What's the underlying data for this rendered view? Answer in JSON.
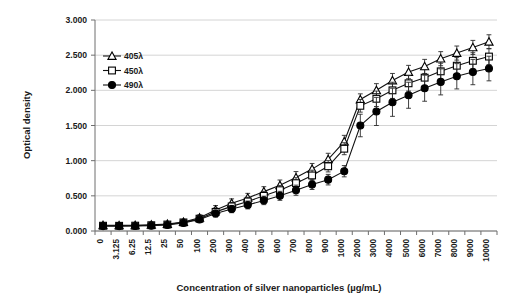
{
  "chart_data": {
    "type": "line",
    "title": "",
    "xlabel": "Concentration of silver nanoparticles (µg/mL)",
    "ylabel": "Optical density",
    "grid": true,
    "legend_position": "inside-upper-left",
    "ylim": [
      0.0,
      3.0
    ],
    "ytick_labels": [
      "0.000",
      "0.500",
      "1.000",
      "1.500",
      "2.000",
      "2.500",
      "3.000"
    ],
    "ytick_values": [
      0.0,
      0.5,
      1.0,
      1.5,
      2.0,
      2.5,
      3.0
    ],
    "categories": [
      "0",
      "3.125",
      "6.25",
      "12.5",
      "25",
      "50",
      "100",
      "200",
      "300",
      "400",
      "500",
      "600",
      "700",
      "800",
      "900",
      "1000",
      "2000",
      "3000",
      "4000",
      "5000",
      "6000",
      "7000",
      "8000",
      "9000",
      "10000"
    ],
    "series": [
      {
        "name": "405λ",
        "marker": "open-triangle",
        "values": [
          0.082,
          0.08,
          0.082,
          0.088,
          0.098,
          0.128,
          0.188,
          0.3,
          0.395,
          0.47,
          0.56,
          0.65,
          0.76,
          0.88,
          1.02,
          1.27,
          1.87,
          2.0,
          2.14,
          2.26,
          2.34,
          2.45,
          2.53,
          2.61,
          2.69
        ],
        "errors": [
          0.02,
          0.018,
          0.018,
          0.02,
          0.022,
          0.026,
          0.04,
          0.062,
          0.062,
          0.065,
          0.07,
          0.075,
          0.085,
          0.08,
          0.085,
          0.09,
          0.08,
          0.095,
          0.1,
          0.095,
          0.1,
          0.1,
          0.1,
          0.1,
          0.1
        ]
      },
      {
        "name": "450λ",
        "marker": "open-square",
        "values": [
          0.075,
          0.074,
          0.076,
          0.082,
          0.092,
          0.122,
          0.175,
          0.272,
          0.35,
          0.42,
          0.5,
          0.58,
          0.68,
          0.79,
          0.92,
          1.17,
          1.78,
          1.88,
          2.0,
          2.1,
          2.18,
          2.27,
          2.35,
          2.42,
          2.48
        ],
        "errors": [
          0.018,
          0.016,
          0.016,
          0.018,
          0.02,
          0.024,
          0.036,
          0.055,
          0.056,
          0.06,
          0.064,
          0.068,
          0.078,
          0.075,
          0.08,
          0.085,
          0.09,
          0.11,
          0.115,
          0.11,
          0.115,
          0.115,
          0.115,
          0.115,
          0.115
        ]
      },
      {
        "name": "490λ",
        "marker": "filled-circle",
        "values": [
          0.07,
          0.07,
          0.071,
          0.076,
          0.086,
          0.115,
          0.165,
          0.248,
          0.312,
          0.37,
          0.435,
          0.5,
          0.58,
          0.66,
          0.73,
          0.85,
          1.5,
          1.7,
          1.83,
          1.93,
          2.03,
          2.12,
          2.2,
          2.26,
          2.31
        ],
        "errors": [
          0.016,
          0.015,
          0.015,
          0.016,
          0.018,
          0.022,
          0.032,
          0.05,
          0.052,
          0.056,
          0.06,
          0.064,
          0.072,
          0.07,
          0.075,
          0.08,
          0.16,
          0.2,
          0.2,
          0.185,
          0.185,
          0.185,
          0.18,
          0.18,
          0.175
        ]
      }
    ]
  },
  "axes": {
    "y_title": "Optical density",
    "x_title": "Concentration of silver nanoparticles (µg/mL)"
  },
  "legend": {
    "entries": [
      {
        "label": "405λ",
        "marker": "open-triangle"
      },
      {
        "label": "450λ",
        "marker": "open-square"
      },
      {
        "label": "490λ",
        "marker": "filled-circle"
      }
    ]
  },
  "colors": {
    "background": "#ffffff",
    "line": "#111111",
    "grid": "#c9c9c9",
    "axis": "#6e6e6e",
    "text": "#1a1a1a"
  }
}
